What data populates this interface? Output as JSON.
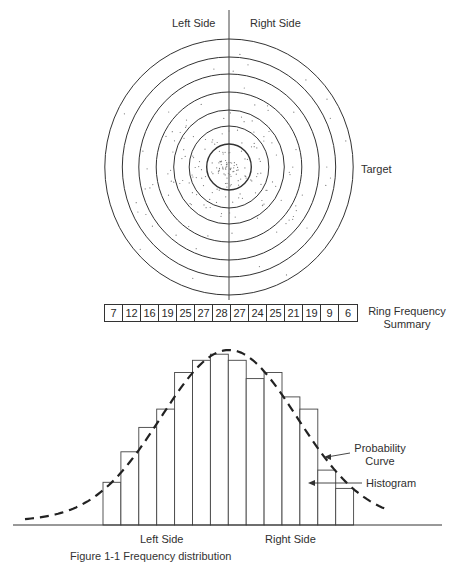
{
  "target_section": {
    "left_label": "Left Side",
    "right_label": "Right Side",
    "target_label": "Target",
    "center": {
      "x": 229,
      "y": 167
    },
    "ring_radii_y": [
      128,
      110,
      93,
      75,
      57,
      41,
      23
    ],
    "aspect_x": 0.97,
    "ring_count": 7
  },
  "frequency_summary": {
    "label_line1": "Ring Frequency",
    "label_line2": "Summary",
    "values": [
      7,
      12,
      16,
      19,
      25,
      27,
      28,
      27,
      24,
      25,
      21,
      19,
      9,
      6
    ]
  },
  "histogram_section": {
    "probability_curve_label_line1": "Probability",
    "probability_curve_label_line2": "Curve",
    "histogram_label": "Histogram",
    "bottom_left_label": "Left Side",
    "bottom_right_label": "Right Side"
  },
  "caption": "Figure 1-1  Frequency distribution",
  "chart_data": {
    "type": "bar",
    "title": "",
    "xlabel": "Left Side / Right Side",
    "ylabel": "",
    "categories": [
      "1",
      "2",
      "3",
      "4",
      "5",
      "6",
      "7",
      "8",
      "9",
      "10",
      "11",
      "12",
      "13",
      "14"
    ],
    "series": [
      {
        "name": "Histogram",
        "values": [
          7,
          12,
          16,
          19,
          25,
          27,
          28,
          27,
          24,
          25,
          21,
          19,
          9,
          6
        ]
      },
      {
        "name": "Probability Curve",
        "type": "line",
        "style": "dashed",
        "shape": "normal distribution"
      }
    ],
    "ylim": [
      0,
      30
    ],
    "grid": false,
    "legend": "annotations with arrows (right side)"
  }
}
